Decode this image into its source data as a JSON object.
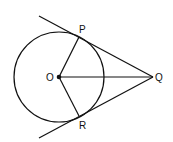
{
  "diagram": {
    "type": "geometry",
    "colors": {
      "stroke": "#111111",
      "background": "#ffffff"
    },
    "points": {
      "O": {
        "label": "O",
        "x": 59,
        "y": 77
      },
      "P": {
        "label": "P",
        "x": 79,
        "y": 36
      },
      "Q": {
        "label": "Q",
        "x": 153,
        "y": 77
      },
      "R": {
        "label": "R",
        "x": 79,
        "y": 117
      }
    },
    "circle": {
      "center": "O",
      "radius": 45
    },
    "segments": [
      "OP",
      "OR",
      "OQ",
      "PQ",
      "RQ"
    ],
    "tangent_lines": [
      "QP (extended)",
      "QR (extended)"
    ]
  }
}
